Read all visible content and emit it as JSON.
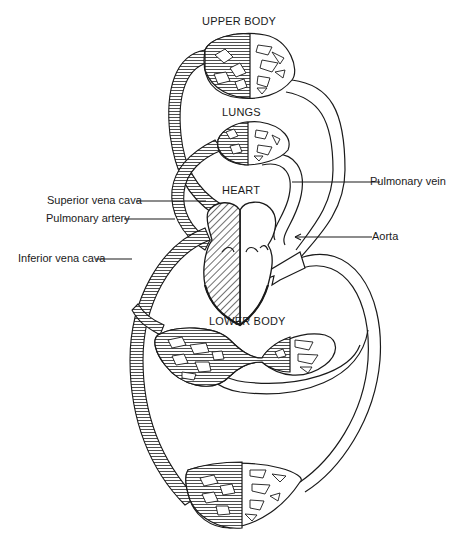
{
  "diagram": {
    "type": "circulatory-system-schematic",
    "colors": {
      "ink": "#1a1a1a",
      "background": "#ffffff",
      "deoxygenated_hatch": "#333333",
      "oxygenated_fill": "#ffffff"
    },
    "regions": {
      "upper_body": "UPPER BODY",
      "lungs": "LUNGS",
      "heart": "HEART",
      "lower_body": "LOWER BODY"
    },
    "callouts": {
      "superior_vena_cava": "Superior vena cava",
      "pulmonary_artery": "Pulmonary artery",
      "inferior_vena_cava": "Inferior vena cava",
      "pulmonary_vein": "Pulmonary vein",
      "aorta": "Aorta"
    }
  }
}
